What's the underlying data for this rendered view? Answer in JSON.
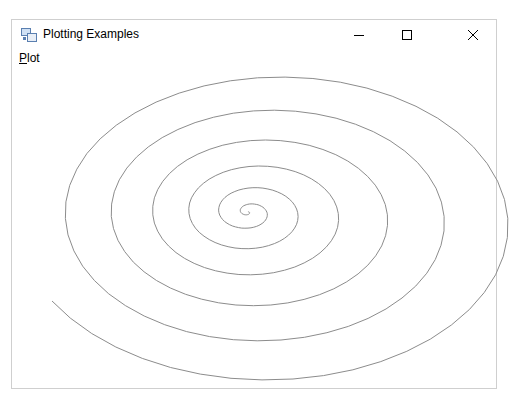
{
  "window": {
    "title": "Plotting Examples",
    "controls": {
      "minimize": "minimize",
      "maximize": "maximize",
      "close": "close"
    }
  },
  "menubar": {
    "items": [
      {
        "label": "Plot",
        "mnemonic": "P",
        "rest": "lot"
      }
    ]
  },
  "plot": {
    "type": "spiral",
    "stroke_color": "#8c8c8c",
    "center": [
      248,
      212
    ],
    "turns": 6.6,
    "end_point": [
      22,
      293
    ],
    "rx_ratio": 1.55
  }
}
